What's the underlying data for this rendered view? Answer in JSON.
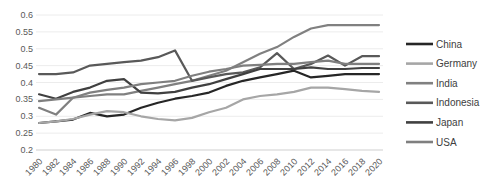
{
  "chart_data": {
    "type": "line",
    "title": "",
    "xlabel": "",
    "ylabel": "",
    "x": [
      1980,
      1982,
      1984,
      1986,
      1988,
      1990,
      1992,
      1994,
      1996,
      1998,
      2000,
      2002,
      2004,
      2006,
      2008,
      2010,
      2012,
      2014,
      2016,
      2018,
      2020
    ],
    "x_tick_labels": [
      "1980",
      "1982",
      "1984",
      "1986",
      "1988",
      "1990",
      "1992",
      "1994",
      "1996",
      "1998",
      "2000",
      "2002",
      "2004",
      "2006",
      "2008",
      "2010",
      "2012",
      "2014",
      "2016",
      "2018",
      "2020"
    ],
    "y_tick_labels": [
      "0.6",
      "0.55",
      "0.5",
      "0.45",
      "0.4",
      "0.35",
      "0.3",
      "0.25",
      "0.2"
    ],
    "ylim": [
      0.2,
      0.6
    ],
    "y_step": 0.05,
    "grid": "horizontal",
    "legend_position": "right",
    "series": [
      {
        "name": "China",
        "color": "#262626",
        "values": [
          0.28,
          0.285,
          0.29,
          0.31,
          0.3,
          0.305,
          0.325,
          0.34,
          0.352,
          0.36,
          0.37,
          0.39,
          0.405,
          0.415,
          0.425,
          0.435,
          0.415,
          0.42,
          0.425,
          0.425,
          0.425
        ]
      },
      {
        "name": "Germany",
        "color": "#a6a6a6",
        "values": [
          0.28,
          0.285,
          0.292,
          0.305,
          0.315,
          0.312,
          0.3,
          0.292,
          0.288,
          0.295,
          0.312,
          0.325,
          0.35,
          0.36,
          0.365,
          0.372,
          0.385,
          0.385,
          0.38,
          0.375,
          0.372
        ]
      },
      {
        "name": "India",
        "color": "#808080",
        "values": [
          0.325,
          0.305,
          0.355,
          0.36,
          0.365,
          0.365,
          0.375,
          0.385,
          0.395,
          0.405,
          0.42,
          0.435,
          0.46,
          0.485,
          0.505,
          0.535,
          0.56,
          0.57,
          0.57,
          0.57,
          0.57
        ]
      },
      {
        "name": "Indonesia",
        "color": "#595959",
        "values": [
          0.425,
          0.425,
          0.43,
          0.45,
          0.455,
          0.46,
          0.465,
          0.475,
          0.495,
          0.405,
          0.415,
          0.425,
          0.43,
          0.445,
          0.487,
          0.44,
          0.455,
          0.48,
          0.45,
          0.478,
          0.478
        ]
      },
      {
        "name": "Japan",
        "color": "#404040",
        "values": [
          0.365,
          0.352,
          0.372,
          0.385,
          0.405,
          0.41,
          0.37,
          0.368,
          0.372,
          0.385,
          0.395,
          0.41,
          0.425,
          0.44,
          0.44,
          0.44,
          0.445,
          0.44,
          0.44,
          0.443,
          0.443
        ]
      },
      {
        "name": "USA",
        "color": "#7f7f7f",
        "values": [
          0.345,
          0.35,
          0.355,
          0.37,
          0.378,
          0.385,
          0.395,
          0.4,
          0.405,
          0.42,
          0.432,
          0.44,
          0.45,
          0.452,
          0.455,
          0.455,
          0.46,
          0.465,
          0.455,
          0.455,
          0.455
        ]
      }
    ]
  },
  "styles": {
    "background": "#ffffff",
    "gridline_color": "#ececec",
    "axis_line_color": "#d9d9d9",
    "axis_text_color": "#595959",
    "legend_text_color": "#404040"
  }
}
